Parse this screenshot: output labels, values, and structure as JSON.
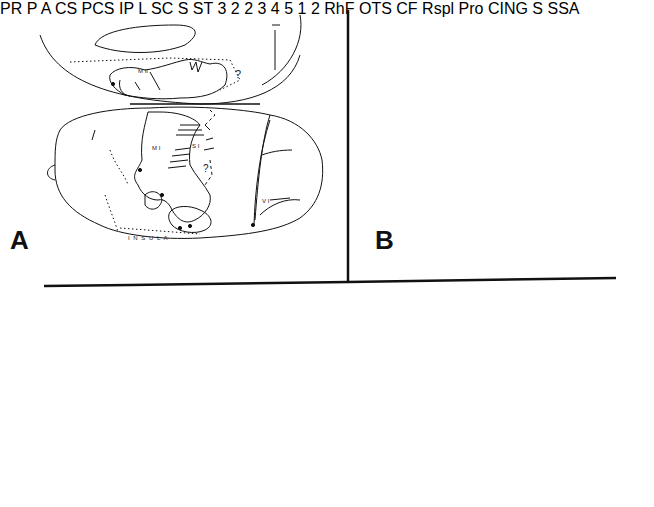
{
  "figure": {
    "panels": [
      {
        "letter": "A",
        "description": "Dorsal view of brain with somatotopic map drawings",
        "labels": {
          "m2": "M II",
          "m1": "M I",
          "s1": "S I",
          "v1": "V I",
          "insula": "I N S U L A",
          "q1": "?",
          "q2": "?"
        }
      },
      {
        "letter": "B",
        "description": "Lateral view of hemisphere with shaded cortical strip",
        "labels": {
          "pr": "PR",
          "p": "P",
          "a": "A",
          "cs": "CS",
          "pcs": "PCS",
          "ip": "IP",
          "l": "L",
          "sc": "SC",
          "s": "S",
          "st": "ST",
          "n3a": "3",
          "n2a": "2",
          "n2b": "2",
          "n3b": "3",
          "n4": "4",
          "n5": "5",
          "n1": "1",
          "n2c": "2"
        }
      },
      {
        "letter": "",
        "description": "Medial view of hemisphere",
        "labels": {
          "rhf": "RhF",
          "ots": "OTS",
          "cf": "CF",
          "rspl": "Rspl",
          "pro": "Pro",
          "cing": "CING S",
          "ssa": "SSA"
        }
      }
    ],
    "colors": {
      "ink": "#111111",
      "background": "#ffffff",
      "shade": "#6a6a6a"
    }
  }
}
